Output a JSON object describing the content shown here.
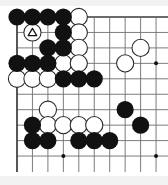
{
  "diagram": {
    "kind": "go-board-diagram",
    "board_size": 19,
    "visible_columns": 10,
    "visible_rows": 10,
    "edges_shown": [
      "left",
      "top"
    ],
    "geometry": {
      "origin_x": 17,
      "origin_y": 17,
      "spacing": 15.45,
      "stone_radius": 8.6,
      "line_color": "#6e6e6e",
      "edge_line_color": "#3a3a3a",
      "background": "#ffffff"
    },
    "colors": {
      "black_stone": "#111111",
      "white_stone": "#ffffff",
      "white_stone_outline": "#2a2a2a",
      "marker": "#111111",
      "star_point": "#111111"
    },
    "star_points": [
      {
        "col": 4,
        "row": 4
      },
      {
        "col": 10,
        "row": 4
      },
      {
        "col": 4,
        "row": 10
      },
      {
        "col": 10,
        "row": 10
      }
    ],
    "black_stones": [
      {
        "col": 1,
        "row": 1
      },
      {
        "col": 2,
        "row": 1
      },
      {
        "col": 3,
        "row": 1
      },
      {
        "col": 4,
        "row": 1
      },
      {
        "col": 4,
        "row": 2
      },
      {
        "col": 3,
        "row": 3
      },
      {
        "col": 4,
        "row": 3
      },
      {
        "col": 1,
        "row": 4
      },
      {
        "col": 2,
        "row": 4
      },
      {
        "col": 3,
        "row": 4
      },
      {
        "col": 4,
        "row": 5
      },
      {
        "col": 5,
        "row": 5
      },
      {
        "col": 6,
        "row": 5
      },
      {
        "col": 8,
        "row": 7
      },
      {
        "col": 2,
        "row": 8
      },
      {
        "col": 9,
        "row": 8
      },
      {
        "col": 2,
        "row": 9
      },
      {
        "col": 3,
        "row": 9
      },
      {
        "col": 5,
        "row": 9
      },
      {
        "col": 6,
        "row": 9
      },
      {
        "col": 7,
        "row": 9
      }
    ],
    "white_stones": [
      {
        "col": 5,
        "row": 1
      },
      {
        "col": 2,
        "row": 2,
        "marker": "triangle"
      },
      {
        "col": 5,
        "row": 2
      },
      {
        "col": 5,
        "row": 3
      },
      {
        "col": 9,
        "row": 3
      },
      {
        "col": 4,
        "row": 4
      },
      {
        "col": 5,
        "row": 4
      },
      {
        "col": 8,
        "row": 4
      },
      {
        "col": 1,
        "row": 5
      },
      {
        "col": 2,
        "row": 5
      },
      {
        "col": 3,
        "row": 5
      },
      {
        "col": 3,
        "row": 7
      },
      {
        "col": 3,
        "row": 8
      },
      {
        "col": 4,
        "row": 8
      },
      {
        "col": 5,
        "row": 8
      },
      {
        "col": 6,
        "row": 8
      }
    ],
    "markers": [
      {
        "col": 2,
        "row": 2,
        "glyph": "triangle",
        "label": "marked-white-stone"
      }
    ],
    "legend": {
      "triangle_meaning": "marked stone"
    }
  }
}
